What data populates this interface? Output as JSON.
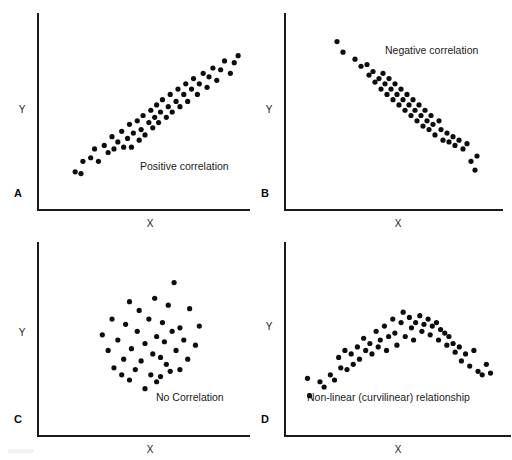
{
  "figure": {
    "title_visible": false,
    "background_color": "#ffffff",
    "ink_color": "#0d0d0d",
    "axis_color": "#1a1a1a",
    "panel_count": 4
  },
  "chart_data": [
    {
      "type": "scatter",
      "panel": "A",
      "panel_letter": "A",
      "title": "Positive correlation",
      "annotation": "Positive correlation",
      "xlabel": "X",
      "ylabel": "Y",
      "grid": false,
      "legend": "none",
      "axis_ticks": "none",
      "xlim": [
        0,
        100
      ],
      "ylim": [
        0,
        100
      ],
      "points": [
        [
          14,
          16
        ],
        [
          17,
          15
        ],
        [
          18,
          22
        ],
        [
          22,
          24
        ],
        [
          24,
          29
        ],
        [
          26,
          22
        ],
        [
          29,
          31
        ],
        [
          31,
          27
        ],
        [
          33,
          36
        ],
        [
          34,
          29
        ],
        [
          36,
          33
        ],
        [
          38,
          39
        ],
        [
          39,
          30
        ],
        [
          41,
          35
        ],
        [
          42,
          43
        ],
        [
          43,
          30
        ],
        [
          44,
          38
        ],
        [
          46,
          45
        ],
        [
          47,
          34
        ],
        [
          48,
          40
        ],
        [
          49,
          48
        ],
        [
          50,
          37
        ],
        [
          52,
          44
        ],
        [
          53,
          51
        ],
        [
          54,
          41
        ],
        [
          55,
          47
        ],
        [
          56,
          54
        ],
        [
          57,
          44
        ],
        [
          58,
          50
        ],
        [
          59,
          57
        ],
        [
          61,
          47
        ],
        [
          62,
          53
        ],
        [
          63,
          60
        ],
        [
          64,
          50
        ],
        [
          66,
          56
        ],
        [
          67,
          63
        ],
        [
          68,
          53
        ],
        [
          70,
          60
        ],
        [
          71,
          66
        ],
        [
          72,
          56
        ],
        [
          74,
          63
        ],
        [
          75,
          69
        ],
        [
          77,
          60
        ],
        [
          78,
          66
        ],
        [
          80,
          72
        ],
        [
          82,
          64
        ],
        [
          83,
          70
        ],
        [
          85,
          75
        ],
        [
          87,
          68
        ],
        [
          89,
          74
        ],
        [
          91,
          79
        ],
        [
          94,
          72
        ],
        [
          96,
          78
        ],
        [
          98,
          82
        ]
      ]
    },
    {
      "type": "scatter",
      "panel": "B",
      "panel_letter": "B",
      "title": "Negative correlation",
      "annotation": "Negative correlation",
      "xlabel": "X",
      "ylabel": "Y",
      "grid": false,
      "legend": "none",
      "axis_ticks": "none",
      "xlim": [
        0,
        100
      ],
      "ylim": [
        0,
        100
      ],
      "points": [
        [
          21,
          90
        ],
        [
          24,
          84
        ],
        [
          30,
          80
        ],
        [
          33,
          76
        ],
        [
          36,
          77
        ],
        [
          37,
          71
        ],
        [
          39,
          73
        ],
        [
          40,
          67
        ],
        [
          42,
          69
        ],
        [
          43,
          63
        ],
        [
          44,
          72
        ],
        [
          45,
          66
        ],
        [
          46,
          60
        ],
        [
          47,
          69
        ],
        [
          48,
          63
        ],
        [
          49,
          57
        ],
        [
          50,
          66
        ],
        [
          51,
          60
        ],
        [
          52,
          54
        ],
        [
          53,
          63
        ],
        [
          54,
          57
        ],
        [
          55,
          51
        ],
        [
          56,
          60
        ],
        [
          57,
          54
        ],
        [
          58,
          48
        ],
        [
          59,
          57
        ],
        [
          60,
          51
        ],
        [
          61,
          45
        ],
        [
          62,
          54
        ],
        [
          63,
          48
        ],
        [
          64,
          42
        ],
        [
          65,
          51
        ],
        [
          66,
          45
        ],
        [
          67,
          40
        ],
        [
          68,
          48
        ],
        [
          69,
          43
        ],
        [
          70,
          37
        ],
        [
          72,
          45
        ],
        [
          73,
          40
        ],
        [
          74,
          34
        ],
        [
          76,
          38
        ],
        [
          77,
          33
        ],
        [
          79,
          36
        ],
        [
          80,
          31
        ],
        [
          82,
          34
        ],
        [
          84,
          29
        ],
        [
          86,
          32
        ],
        [
          88,
          22
        ],
        [
          90,
          17
        ],
        [
          91,
          25
        ]
      ]
    },
    {
      "type": "scatter",
      "panel": "C",
      "panel_letter": "C",
      "title": "No Correlation",
      "annotation": "No Correlation",
      "xlabel": "X",
      "ylabel": "Y",
      "grid": false,
      "legend": "none",
      "axis_ticks": "none",
      "xlim": [
        0,
        100
      ],
      "ylim": [
        0,
        100
      ],
      "points": [
        [
          65,
          83
        ],
        [
          42,
          72
        ],
        [
          55,
          74
        ],
        [
          62,
          70
        ],
        [
          47,
          67
        ],
        [
          73,
          68
        ],
        [
          33,
          62
        ],
        [
          52,
          62
        ],
        [
          40,
          59
        ],
        [
          59,
          60
        ],
        [
          68,
          57
        ],
        [
          28,
          53
        ],
        [
          46,
          55
        ],
        [
          56,
          52
        ],
        [
          64,
          55
        ],
        [
          78,
          58
        ],
        [
          36,
          50
        ],
        [
          50,
          48
        ],
        [
          60,
          49
        ],
        [
          70,
          50
        ],
        [
          31,
          44
        ],
        [
          43,
          45
        ],
        [
          54,
          42
        ],
        [
          66,
          44
        ],
        [
          39,
          39
        ],
        [
          48,
          38
        ],
        [
          58,
          40
        ],
        [
          72,
          39
        ],
        [
          34,
          34
        ],
        [
          45,
          33
        ],
        [
          53,
          30
        ],
        [
          61,
          36
        ],
        [
          63,
          32
        ],
        [
          68,
          33
        ],
        [
          42,
          27
        ],
        [
          56,
          26
        ],
        [
          50,
          22
        ],
        [
          58,
          29
        ],
        [
          38,
          30
        ],
        [
          76,
          47
        ]
      ]
    },
    {
      "type": "scatter",
      "panel": "D",
      "panel_letter": "D",
      "title": "Non-linear (curvilinear) relationship",
      "annotation": "Non-linear (curvilinear) relationship",
      "xlabel": "X",
      "ylabel": "Y",
      "grid": false,
      "legend": "none",
      "axis_ticks": "none",
      "xlim": [
        0,
        100
      ],
      "ylim": [
        0,
        100
      ],
      "points": [
        [
          6,
          28
        ],
        [
          7,
          18
        ],
        [
          12,
          26
        ],
        [
          14,
          23
        ],
        [
          17,
          30
        ],
        [
          19,
          27
        ],
        [
          21,
          40
        ],
        [
          22,
          34
        ],
        [
          24,
          44
        ],
        [
          25,
          33
        ],
        [
          27,
          42
        ],
        [
          28,
          36
        ],
        [
          30,
          46
        ],
        [
          31,
          39
        ],
        [
          33,
          51
        ],
        [
          34,
          44
        ],
        [
          36,
          48
        ],
        [
          37,
          42
        ],
        [
          39,
          55
        ],
        [
          40,
          46
        ],
        [
          41,
          50
        ],
        [
          43,
          58
        ],
        [
          44,
          44
        ],
        [
          45,
          52
        ],
        [
          47,
          62
        ],
        [
          48,
          54
        ],
        [
          49,
          47
        ],
        [
          51,
          60
        ],
        [
          52,
          66
        ],
        [
          53,
          52
        ],
        [
          55,
          63
        ],
        [
          56,
          57
        ],
        [
          57,
          50
        ],
        [
          58,
          60
        ],
        [
          60,
          64
        ],
        [
          61,
          55
        ],
        [
          62,
          59
        ],
        [
          64,
          62
        ],
        [
          65,
          53
        ],
        [
          66,
          58
        ],
        [
          68,
          60
        ],
        [
          69,
          50
        ],
        [
          70,
          56
        ],
        [
          72,
          54
        ],
        [
          73,
          47
        ],
        [
          74,
          52
        ],
        [
          76,
          48
        ],
        [
          77,
          43
        ],
        [
          79,
          46
        ],
        [
          80,
          38
        ],
        [
          82,
          42
        ],
        [
          84,
          35
        ],
        [
          86,
          44
        ],
        [
          88,
          32
        ],
        [
          90,
          30
        ],
        [
          92,
          36
        ],
        [
          94,
          31
        ]
      ]
    }
  ],
  "panels": {
    "a": {
      "letter": "A",
      "annotation": "Positive correlation",
      "xlabel": "X",
      "ylabel": "Y"
    },
    "b": {
      "letter": "B",
      "annotation": "Negative correlation",
      "xlabel": "X",
      "ylabel": "Y"
    },
    "c": {
      "letter": "C",
      "annotation": "No Correlation",
      "xlabel": "X",
      "ylabel": "Y"
    },
    "d": {
      "letter": "D",
      "annotation": "Non-linear (curvilinear) relationship",
      "xlabel": "X",
      "ylabel": "Y"
    }
  }
}
